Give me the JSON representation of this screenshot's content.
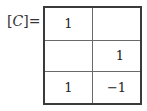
{
  "label": {
    "open_bracket": "[",
    "variable": "C",
    "close_bracket": "]",
    "equals": "="
  },
  "matrix": {
    "rows": [
      [
        "1",
        ""
      ],
      [
        "",
        "1"
      ],
      [
        "1",
        "−1"
      ]
    ]
  }
}
